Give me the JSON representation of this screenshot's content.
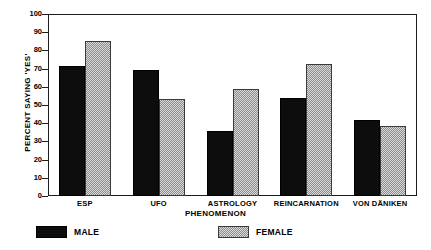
{
  "chart_data": {
    "type": "bar",
    "title": "",
    "xlabel": "PHENOMENON",
    "ylabel": "PERCENT SAYING 'YES'",
    "categories": [
      "ESP",
      "UFO",
      "ASTROLOGY",
      "REINCARNATION",
      "VON DÄNIKEN"
    ],
    "series": [
      {
        "name": "MALE",
        "values": [
          71.5,
          69.5,
          35.5,
          54,
          41.5
        ],
        "color": "#0d0d0d"
      },
      {
        "name": "FEMALE",
        "values": [
          85,
          53.5,
          59,
          72.5,
          38.5
        ],
        "color": "#d8d8d8"
      }
    ],
    "ylim": [
      0,
      100
    ],
    "ytick_labels": [
      "100",
      "90",
      "80",
      "70",
      "60",
      "50",
      "40",
      "30",
      "20",
      "10",
      "0"
    ],
    "ytick_values": [
      100,
      90,
      80,
      70,
      60,
      50,
      40,
      30,
      20,
      10,
      0
    ],
    "grid": false,
    "legend_position": "below-axes"
  },
  "axes": {
    "y_title": "PERCENT SAYING 'YES'",
    "x_title": "PHENOMENON"
  },
  "legend": {
    "entries": [
      {
        "label": "MALE",
        "swatch": "solid-black-swatch"
      },
      {
        "label": "FEMALE",
        "swatch": "stippled-gray-swatch"
      }
    ]
  }
}
